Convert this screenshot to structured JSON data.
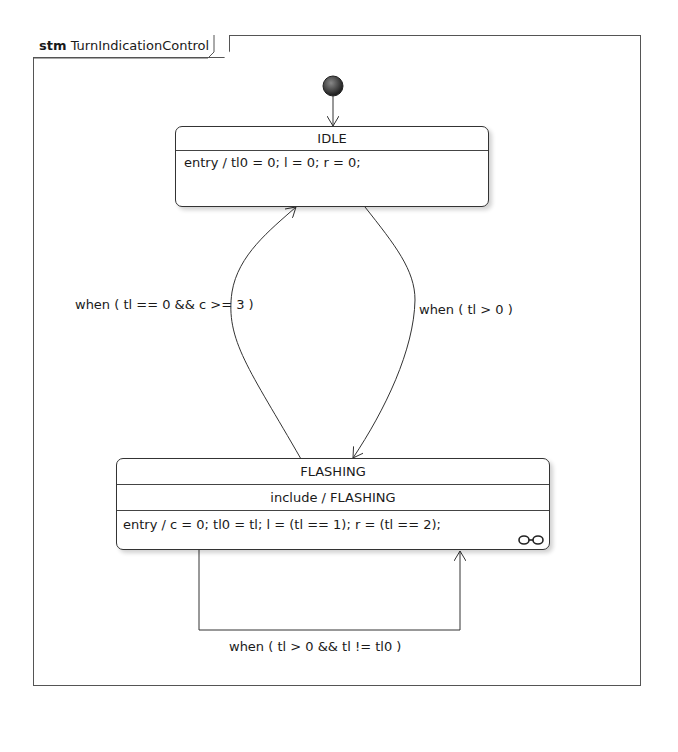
{
  "frame": {
    "keyword": "stm",
    "name": "TurnIndicationControl"
  },
  "states": {
    "idle": {
      "name": "IDLE",
      "entry": "entry / tl0 = 0; l = 0; r = 0;"
    },
    "flashing": {
      "name": "FLASHING",
      "include": "include / FLASHING",
      "entry": "entry / c = 0; tl0 = tl; l = (tl == 1); r = (tl == 2);",
      "submachine_icon": "link-icon"
    }
  },
  "transitions": [
    {
      "id": "flashing-to-idle",
      "from": "FLASHING",
      "to": "IDLE",
      "guard": "when ( tl == 0 && c >= 3 )"
    },
    {
      "id": "idle-to-flashing",
      "from": "IDLE",
      "to": "FLASHING",
      "guard": "when ( tl > 0 )"
    },
    {
      "id": "flashing-self",
      "from": "FLASHING",
      "to": "FLASHING",
      "guard": "when ( tl > 0 && tl != tl0 )"
    }
  ],
  "initial": {
    "target": "IDLE"
  }
}
